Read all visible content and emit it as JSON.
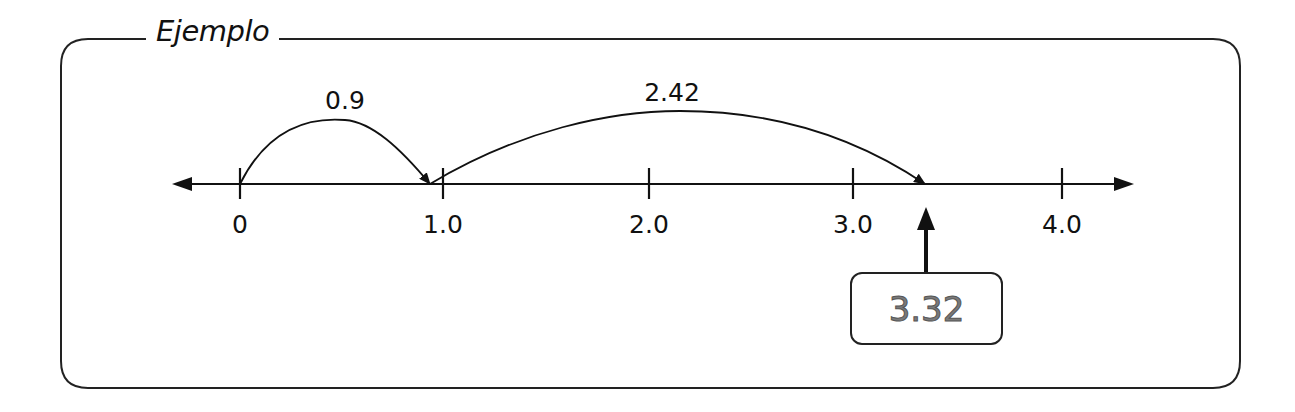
{
  "title": "Ejemplo",
  "number_line": {
    "ticks": [
      {
        "label": "0",
        "value": 0
      },
      {
        "label": "1.0",
        "value": 1.0
      },
      {
        "label": "2.0",
        "value": 2.0
      },
      {
        "label": "3.0",
        "value": 3.0
      },
      {
        "label": "4.0",
        "value": 4.0
      }
    ],
    "jumps": [
      {
        "label": "0.9",
        "from": 0,
        "to": 0.9
      },
      {
        "label": "2.42",
        "from": 0.9,
        "to": 3.32
      }
    ],
    "result": {
      "label": "3.32",
      "value": 3.32
    }
  },
  "colors": {
    "line": "#111111",
    "result_text": "#7a7a7a"
  }
}
